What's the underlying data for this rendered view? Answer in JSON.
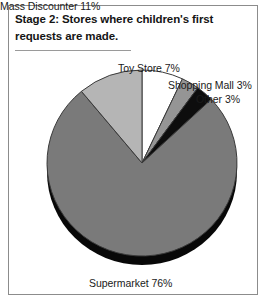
{
  "figure": {
    "title_lines": [
      "Stage 2: Stores where children's first",
      "requests are made."
    ],
    "frame_color": "#8c8c8c",
    "background": "#ffffff"
  },
  "chart_data": {
    "type": "pie",
    "title": "Stage 2: Stores where children's first requests are made.",
    "subtitle": "",
    "xlabel": "",
    "ylabel": "",
    "unit": "percent",
    "total": 100,
    "legend_position": "none",
    "grid": false,
    "start_angle_deg": 0,
    "direction": "clockwise",
    "three_d": true,
    "categories": [
      "Toy Store",
      "Shopping Mall",
      "Other",
      "Supermarket",
      "Mass Discounter"
    ],
    "values": [
      7,
      3,
      3,
      76,
      11
    ],
    "labels": [
      "Toy Store 7%",
      "Shopping Mall 3%",
      "Other 3%",
      "Supermarket 76%",
      "Mass Discounter 11%"
    ],
    "slice_colors": [
      "#ffffff",
      "#959595",
      "#0d0d0d",
      "#7a7a7a",
      "#b5b5b5"
    ],
    "slice_edge_color": "#3a3a3a",
    "shadow_color": "#080808"
  },
  "labels": {
    "toy_store": "Toy Store 7%",
    "shopping_mall": "Shopping Mall 3%",
    "other": "Other 3%",
    "mass_discounter": "Mass Discounter 11%",
    "supermarket": "Supermarket 76%"
  }
}
